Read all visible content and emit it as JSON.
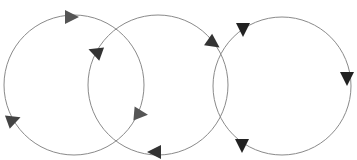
{
  "diagram": {
    "title": "",
    "width": 357,
    "height": 160,
    "background": "#ffffff",
    "stroke_color": "#8a8a8a",
    "circles": [
      {
        "id": "circle-left",
        "cx": 74,
        "cy": 85,
        "r": 70
      },
      {
        "id": "circle-middle",
        "cx": 158,
        "cy": 85,
        "r": 70
      },
      {
        "id": "circle-right",
        "cx": 282,
        "cy": 86,
        "r": 69
      }
    ],
    "arrowheads": [
      {
        "id": "arrow-left-top",
        "circle": "circle-left",
        "x": 71,
        "y": 17,
        "angle": 0,
        "color": "#555555"
      },
      {
        "id": "arrow-left-lower-left",
        "circle": "circle-left",
        "x": 13,
        "y": 120,
        "angle": -20,
        "color": "#444444"
      },
      {
        "id": "arrow-left-lower-right",
        "circle": "circle-left",
        "x": 140,
        "y": 114,
        "angle": 5,
        "color": "#555555"
      },
      {
        "id": "arrow-middle-upper-left",
        "circle": "circle-middle",
        "x": 96,
        "y": 52,
        "angle": 200,
        "color": "#333333"
      },
      {
        "id": "arrow-middle-bottom",
        "circle": "circle-middle",
        "x": 155,
        "y": 152,
        "angle": 180,
        "color": "#333333"
      },
      {
        "id": "arrow-middle-upper-right",
        "circle": "circle-middle",
        "x": 213,
        "y": 43,
        "angle": 35,
        "color": "#333333"
      },
      {
        "id": "arrow-right-upper-left",
        "circle": "circle-right",
        "x": 243,
        "y": 29,
        "angle": 90,
        "color": "#222222"
      },
      {
        "id": "arrow-right-right",
        "circle": "circle-right",
        "x": 347,
        "y": 78,
        "angle": 90,
        "color": "#222222"
      },
      {
        "id": "arrow-right-lower-left",
        "circle": "circle-right",
        "x": 242,
        "y": 145,
        "angle": 90,
        "color": "#222222"
      }
    ]
  }
}
